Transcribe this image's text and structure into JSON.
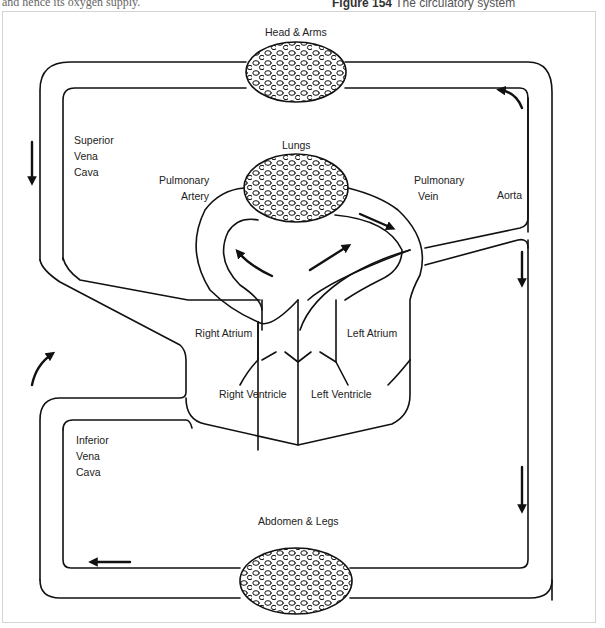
{
  "page": {
    "top_text": "and hence its oxygen supply.",
    "caption_prefix": "Figure 154",
    "caption_text": "The circulatory system"
  },
  "diagram": {
    "labels": {
      "head_arms": "Head & Arms",
      "lungs": "Lungs",
      "superior_vena_cava": [
        "Superior",
        "Vena",
        "Cava"
      ],
      "pulmonary_artery": [
        "Pulmonary",
        "Artery"
      ],
      "pulmonary_vein": [
        "Pulmonary",
        "Vein"
      ],
      "aorta": "Aorta",
      "right_atrium": "Right Atrium",
      "left_atrium": "Left Atrium",
      "right_ventricle": "Right Ventricle",
      "left_ventricle": "Left Ventricle",
      "inferior_vena_cava": [
        "Inferior",
        "Vena",
        "Cava"
      ],
      "abdomen_legs": "Abdomen & Legs"
    },
    "arrows": [
      {
        "name": "superior-vena-cava-flow",
        "direction": "down"
      },
      {
        "name": "aorta-top-flow",
        "direction": "curved-up-left"
      },
      {
        "name": "pulmonary-artery-flow",
        "direction": "up-left"
      },
      {
        "name": "pulmonary-vein-flow",
        "direction": "up-right"
      },
      {
        "name": "lungs-to-vein-flow",
        "direction": "down-right"
      },
      {
        "name": "aorta-descending-flow-upper",
        "direction": "down"
      },
      {
        "name": "aorta-descending-flow-lower",
        "direction": "down"
      },
      {
        "name": "inferior-return-flow",
        "direction": "left"
      },
      {
        "name": "inferior-vena-cava-flow",
        "direction": "curved-up-right"
      }
    ],
    "colors": {
      "line": "#111111",
      "text": "#222222",
      "frame": "#d4d4d4"
    }
  }
}
